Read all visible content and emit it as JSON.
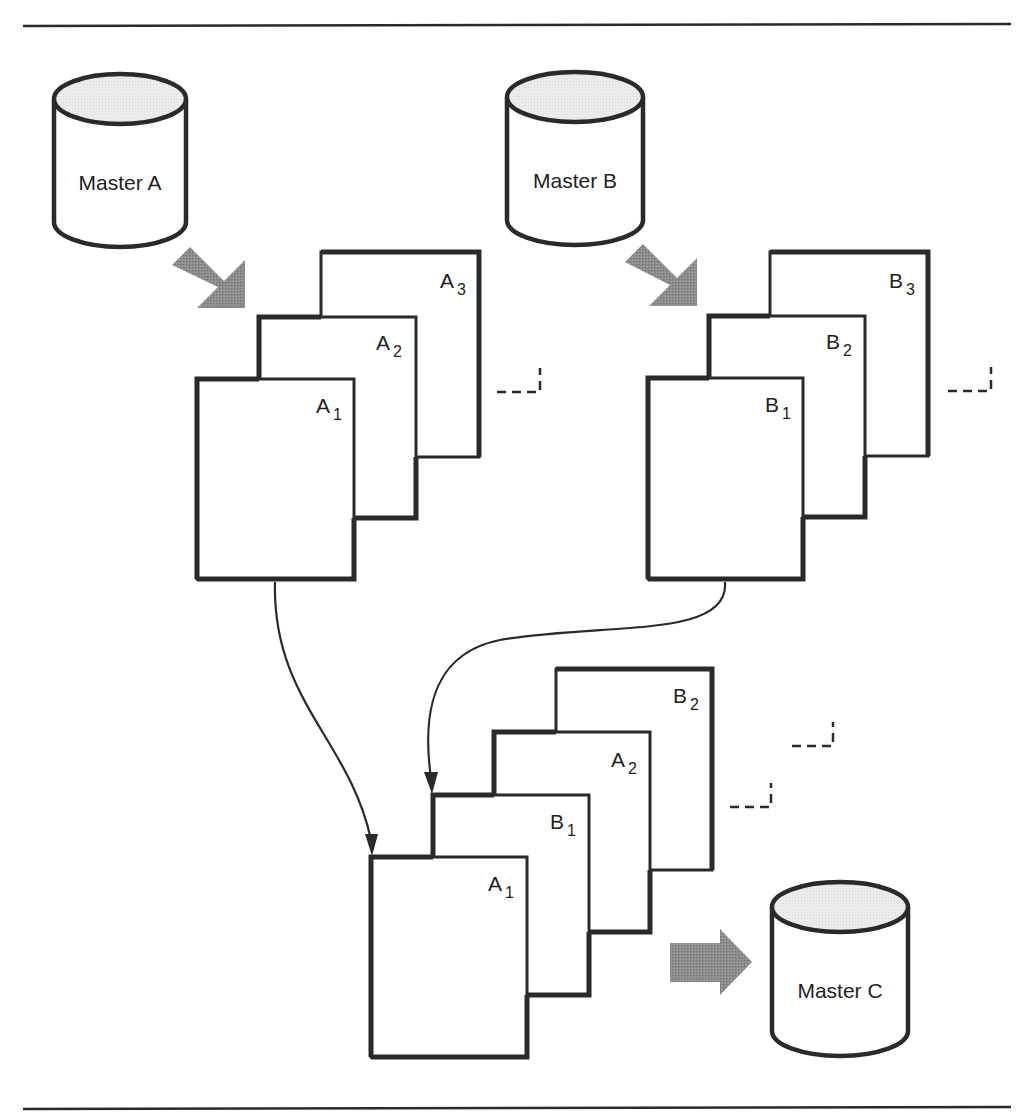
{
  "diagram": {
    "masters": [
      {
        "id": "A",
        "label": "Master A"
      },
      {
        "id": "B",
        "label": "Master B"
      },
      {
        "id": "C",
        "label": "Master C"
      }
    ],
    "stack_a": [
      {
        "letter": "A",
        "sub": "3"
      },
      {
        "letter": "A",
        "sub": "2"
      },
      {
        "letter": "A",
        "sub": "1"
      }
    ],
    "stack_b": [
      {
        "letter": "B",
        "sub": "3"
      },
      {
        "letter": "B",
        "sub": "2"
      },
      {
        "letter": "B",
        "sub": "1"
      }
    ],
    "stack_c": [
      {
        "letter": "B",
        "sub": "2"
      },
      {
        "letter": "A",
        "sub": "2"
      },
      {
        "letter": "B",
        "sub": "1"
      },
      {
        "letter": "A",
        "sub": "1"
      }
    ],
    "colors": {
      "stroke": "#2a2a2a",
      "arrow_fill": "#8a8a8a",
      "cylinder_top": "#e8e8e8",
      "page_fill": "#ffffff"
    }
  }
}
